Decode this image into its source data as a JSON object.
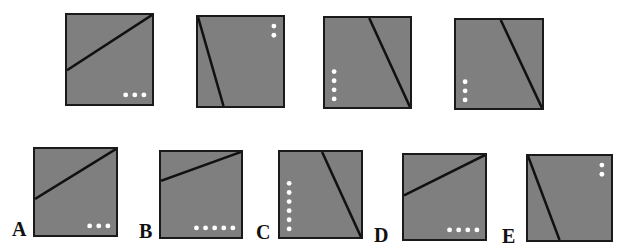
{
  "puzzle": {
    "question_row": [
      {
        "id": "q1",
        "box": [
          65,
          13,
          89,
          93
        ],
        "line": [
          [
            0,
            0.62
          ],
          [
            1,
            0
          ]
        ],
        "dots": {
          "count": 3,
          "orientation": "horizontal",
          "anchor": "bottom-right"
        }
      },
      {
        "id": "q2",
        "box": [
          196,
          15,
          89,
          93
        ],
        "line": [
          [
            0,
            0
          ],
          [
            0.3,
            1
          ]
        ],
        "dots": {
          "count": 2,
          "orientation": "vertical",
          "anchor": "top-right"
        }
      },
      {
        "id": "q3",
        "box": [
          323,
          16,
          89,
          93
        ],
        "line": [
          [
            0.52,
            0
          ],
          [
            1,
            1
          ]
        ],
        "dots": {
          "count": 4,
          "orientation": "vertical",
          "anchor": "bottom-left"
        }
      },
      {
        "id": "q4",
        "box": [
          454,
          18,
          90,
          92
        ],
        "line": [
          [
            0.52,
            0
          ],
          [
            1,
            1
          ]
        ],
        "dots": {
          "count": 3,
          "orientation": "vertical",
          "anchor": "bottom-left"
        }
      }
    ],
    "answer_row": [
      {
        "label": "A",
        "box": [
          33,
          147,
          85,
          90
        ],
        "line": [
          [
            0,
            0.58
          ],
          [
            1,
            0
          ]
        ],
        "dots": {
          "count": 3,
          "orientation": "horizontal",
          "anchor": "bottom-right"
        }
      },
      {
        "label": "B",
        "box": [
          159,
          150,
          84,
          89
        ],
        "line": [
          [
            0,
            0.34
          ],
          [
            1,
            0
          ]
        ],
        "dots": {
          "count": 5,
          "orientation": "horizontal",
          "anchor": "bottom-right"
        }
      },
      {
        "label": "C",
        "box": [
          278,
          150,
          85,
          89
        ],
        "line": [
          [
            0.52,
            0
          ],
          [
            1,
            1
          ]
        ],
        "dots": {
          "count": 6,
          "orientation": "vertical",
          "anchor": "bottom-left"
        }
      },
      {
        "label": "D",
        "box": [
          402,
          153,
          85,
          88
        ],
        "line": [
          [
            0,
            0.48
          ],
          [
            1,
            0
          ]
        ],
        "dots": {
          "count": 4,
          "orientation": "horizontal",
          "anchor": "bottom-right"
        }
      },
      {
        "label": "E",
        "box": [
          526,
          154,
          87,
          88
        ],
        "line": [
          [
            0,
            0
          ],
          [
            0.38,
            1
          ]
        ],
        "dots": {
          "count": 2,
          "orientation": "vertical",
          "anchor": "top-right"
        }
      }
    ],
    "labels": [
      {
        "text": "A",
        "x": 12,
        "y": 218
      },
      {
        "text": "B",
        "x": 139,
        "y": 220
      },
      {
        "text": "C",
        "x": 256,
        "y": 221
      },
      {
        "text": "D",
        "x": 374,
        "y": 224
      },
      {
        "text": "E",
        "x": 502,
        "y": 225
      }
    ],
    "colors": {
      "panel_fill": "#7f7f7f",
      "border": "#1a1a1a",
      "line": "#111111",
      "dot": "#ffffff"
    }
  }
}
